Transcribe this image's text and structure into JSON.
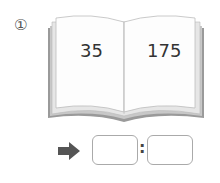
{
  "problem": {
    "number_label": "①",
    "left_page_value": "35",
    "right_page_value": "175",
    "answer_separator": ":",
    "answer_left": "",
    "answer_right": ""
  },
  "icons": {
    "arrow": "right-arrow-icon",
    "book": "open-book-illustration"
  }
}
